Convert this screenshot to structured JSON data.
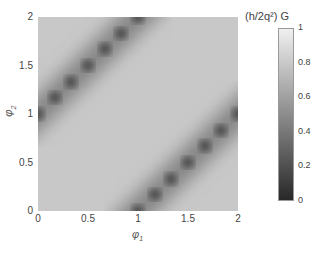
{
  "chart_data": {
    "type": "heatmap",
    "title": "",
    "xlabel": "φ1",
    "ylabel": "φ2",
    "xlim": [
      0,
      2
    ],
    "ylim": [
      0,
      2
    ],
    "xticks": [
      0,
      0.5,
      1,
      1.5,
      2
    ],
    "yticks": [
      0,
      0.5,
      1,
      1.5,
      2
    ],
    "xtick_labels": [
      "0",
      "0.5",
      "1",
      "1.5",
      "2"
    ],
    "ytick_labels": [
      "0",
      "0.5",
      "1",
      "1.5",
      "2"
    ],
    "colormap": "gray",
    "colorbar": {
      "label": "(h/2q²) G",
      "range": [
        0,
        1
      ],
      "ticks": [
        0,
        0.2,
        0.4,
        0.6,
        0.8,
        1
      ],
      "tick_labels": [
        "0",
        "0.2",
        "0.4",
        "0.6",
        "0.8",
        "1"
      ]
    },
    "features": [
      {
        "type": "dark_band",
        "line": "phi2 = phi1 + 1",
        "from": [
          0,
          1
        ],
        "to": [
          1,
          2
        ],
        "min_value": 0.2
      },
      {
        "type": "dark_band",
        "line": "phi2 = phi1 - 1",
        "from": [
          1,
          0
        ],
        "to": [
          2,
          1
        ],
        "min_value": 0.2
      }
    ],
    "dark_spots_upper": [
      [
        0.0,
        1.0
      ],
      [
        0.17,
        1.17
      ],
      [
        0.33,
        1.33
      ],
      [
        0.5,
        1.5
      ],
      [
        0.67,
        1.67
      ],
      [
        0.83,
        1.83
      ],
      [
        1.0,
        2.0
      ]
    ],
    "dark_spots_lower": [
      [
        1.0,
        0.0
      ],
      [
        1.17,
        0.17
      ],
      [
        1.33,
        0.33
      ],
      [
        1.5,
        0.5
      ],
      [
        1.67,
        0.67
      ],
      [
        1.83,
        0.83
      ],
      [
        2.0,
        1.0
      ]
    ],
    "background_value": 0.8,
    "grid": false,
    "legend": "colorbar right"
  },
  "axes": {
    "xlabel_main": "φ",
    "xlabel_sub": "1",
    "ylabel_main": "φ",
    "ylabel_sub": "2"
  }
}
